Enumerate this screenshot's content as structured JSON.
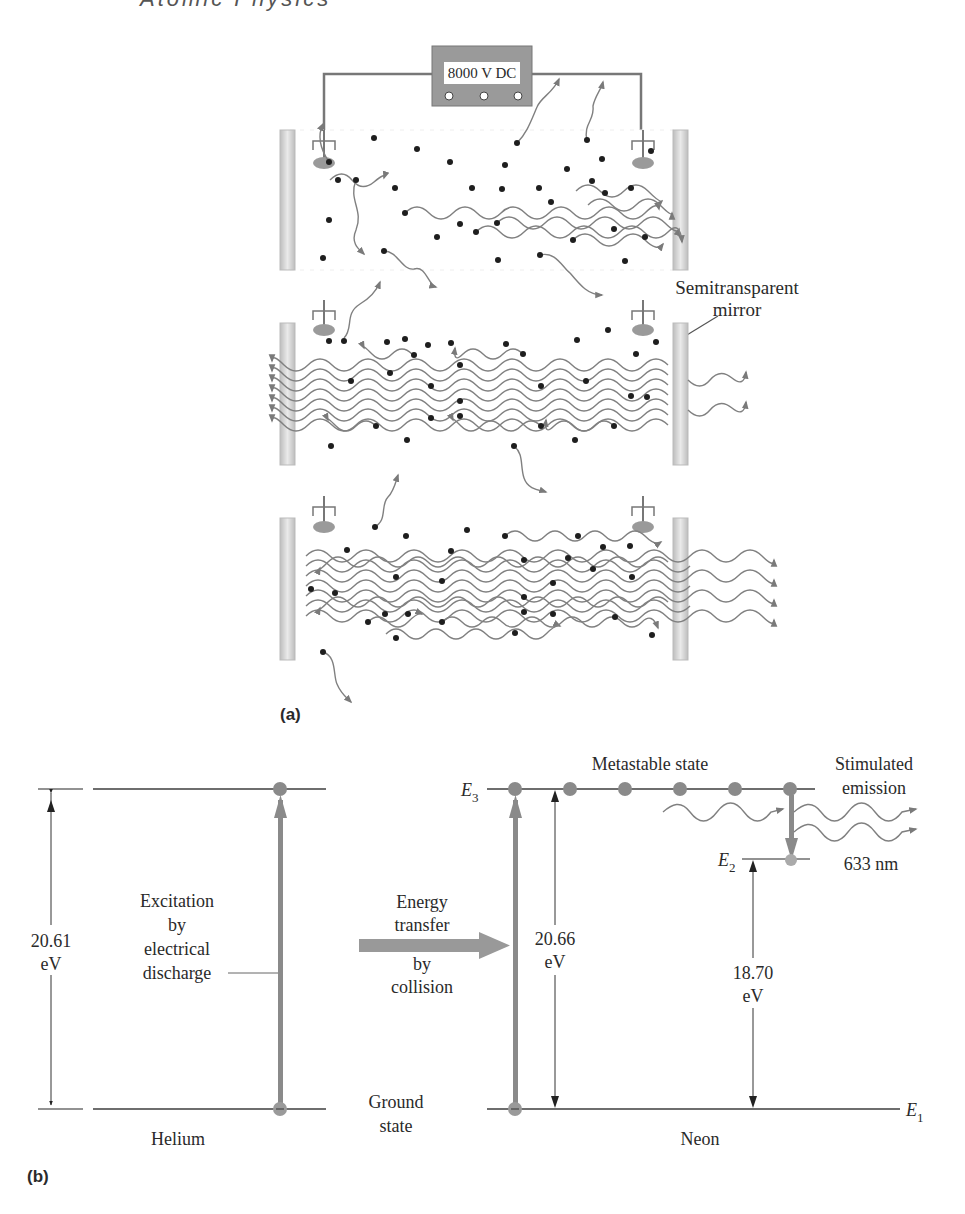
{
  "header": {
    "title": "Atomic Physics"
  },
  "panel_a": {
    "label": "(a)",
    "power_supply": {
      "label": "8000 V DC",
      "lights": 3
    },
    "mirror_label_line1": "Semitransparent",
    "mirror_label_line2": "mirror",
    "tubes": [
      {
        "name": "tube-1",
        "top": 130,
        "bottom": 270,
        "beam_count": 5,
        "stage": "initial emission"
      },
      {
        "name": "tube-2",
        "top": 323,
        "bottom": 465,
        "beam_count": 7,
        "stage": "amplification"
      },
      {
        "name": "tube-3",
        "top": 518,
        "bottom": 660,
        "beam_count": 7,
        "stage": "laser output"
      }
    ]
  },
  "panel_b": {
    "label": "(b)",
    "helium": {
      "name": "Helium",
      "energy_value": "20.61",
      "energy_unit": "eV",
      "excitation_line1": "Excitation",
      "excitation_line2": "by",
      "excitation_line3": "electrical",
      "excitation_line4": "discharge"
    },
    "transfer": {
      "line1": "Energy",
      "line2": "transfer",
      "line3": "by",
      "line4": "collision"
    },
    "ground_state_line1": "Ground",
    "ground_state_line2": "state",
    "neon": {
      "name": "Neon",
      "e3_label": "E",
      "e3_sub": "3",
      "e2_label": "E",
      "e2_sub": "2",
      "e1_label": "E",
      "e1_sub": "1",
      "metastable_label": "Metastable state",
      "stimulated_line1": "Stimulated",
      "stimulated_line2": "emission",
      "wavelength": "633 nm",
      "e3_energy_value": "20.66",
      "e3_energy_unit": "eV",
      "e2_energy_value": "18.70",
      "e2_energy_unit": "eV"
    }
  },
  "colors": {
    "line": "#6e6e6e",
    "electron": "#1e1e1e",
    "atom": "#8a8a8a",
    "mirror": "#c8c8c8",
    "supply": "#9a9a9a"
  }
}
